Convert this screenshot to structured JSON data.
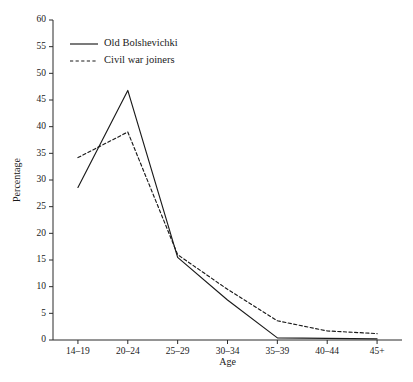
{
  "chart_data": {
    "type": "line",
    "title": "",
    "xlabel": "Age",
    "ylabel": "Percentage",
    "categories": [
      "14–19",
      "20–24",
      "25–29",
      "30–34",
      "35–39",
      "40–44",
      "45+"
    ],
    "ylim": [
      0,
      60
    ],
    "ytick_step": 5,
    "yticks": [
      0,
      5,
      10,
      15,
      20,
      25,
      30,
      35,
      40,
      45,
      50,
      55,
      60
    ],
    "ytick_labels": [
      "0",
      "5",
      "10",
      "15",
      "20",
      "25",
      "30",
      "35",
      "40",
      "45",
      "50",
      "55",
      "60"
    ],
    "grid": false,
    "legend_position": "top-left-inside",
    "series": [
      {
        "name": "Old Bolshevichki",
        "style": "solid",
        "color": "#1a1a1a",
        "values": [
          28.6,
          46.8,
          15.5,
          7.5,
          0.4,
          0.3,
          0.2
        ]
      },
      {
        "name": "Civil war joiners",
        "style": "dashed",
        "color": "#1a1a1a",
        "values": [
          34.2,
          39.0,
          16.0,
          9.5,
          3.6,
          1.7,
          1.2
        ]
      }
    ]
  },
  "legend": {
    "entries": [
      {
        "label": "Old Bolshevichki"
      },
      {
        "label": "Civil war joiners"
      }
    ]
  },
  "axes": {
    "y_title": "Percentage",
    "x_title": "Age"
  }
}
